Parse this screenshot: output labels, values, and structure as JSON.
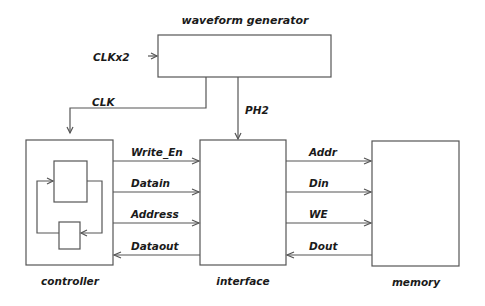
{
  "diagram": {
    "blocks": {
      "waveform_generator": {
        "label": "waveform generator"
      },
      "controller": {
        "label": "controller"
      },
      "interface": {
        "label": "interface"
      },
      "memory": {
        "label": "memory"
      }
    },
    "signals": {
      "clkx2": "CLKx2",
      "clk": "CLK",
      "ph2": "PH2",
      "write_en": "Write_En",
      "datain": "Datain",
      "address": "Address",
      "dataout": "Dataout",
      "addr": "Addr",
      "din": "Din",
      "we": "WE",
      "dout": "Dout"
    },
    "colors": {
      "line": "#555555",
      "text": "#1a1a1a",
      "background": "#ffffff"
    }
  }
}
